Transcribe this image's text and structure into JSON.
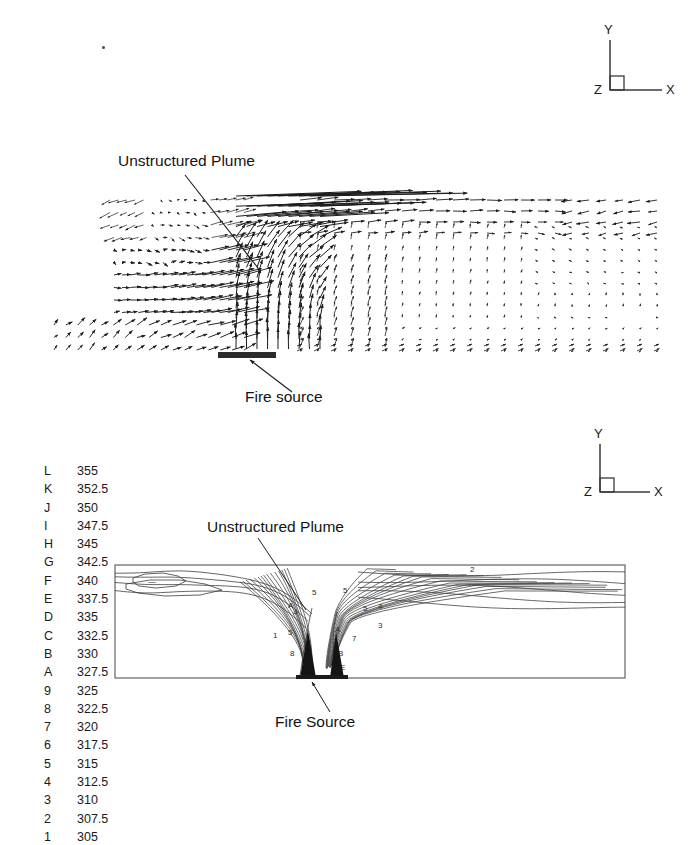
{
  "figure": {
    "panels": [
      {
        "id": "velocity-vector-panel",
        "type": "vector-field",
        "annotations": [
          {
            "label": "Unstructured Plume",
            "x": 118,
            "y": 162
          },
          {
            "label": "Fire source",
            "x": 245,
            "y": 400
          }
        ],
        "axis_triad": {
          "x_label": "X",
          "y_label": "Y",
          "z_label": "Z"
        }
      },
      {
        "id": "temperature-contour-panel",
        "type": "contour",
        "annotations": [
          {
            "label": "Unstructured Plume",
            "x": 207,
            "y": 528
          },
          {
            "label": "Fire Source",
            "x": 275,
            "y": 722
          }
        ],
        "axis_triad": {
          "x_label": "X",
          "y_label": "Y",
          "z_label": "Z"
        }
      }
    ]
  },
  "legend": {
    "title": "",
    "rows": [
      {
        "key": "L",
        "value": "355"
      },
      {
        "key": "K",
        "value": "352.5"
      },
      {
        "key": "J",
        "value": "350"
      },
      {
        "key": "I",
        "value": "347.5"
      },
      {
        "key": "H",
        "value": "345"
      },
      {
        "key": "G",
        "value": "342.5"
      },
      {
        "key": "F",
        "value": "340"
      },
      {
        "key": "E",
        "value": "337.5"
      },
      {
        "key": "D",
        "value": "335"
      },
      {
        "key": "C",
        "value": "332.5"
      },
      {
        "key": "B",
        "value": "330"
      },
      {
        "key": "A",
        "value": "327.5"
      },
      {
        "key": "9",
        "value": "325"
      },
      {
        "key": "8",
        "value": "322.5"
      },
      {
        "key": "7",
        "value": "320"
      },
      {
        "key": "6",
        "value": "317.5"
      },
      {
        "key": "5",
        "value": "315"
      },
      {
        "key": "4",
        "value": "312.5"
      },
      {
        "key": "3",
        "value": "310"
      },
      {
        "key": "2",
        "value": "307.5"
      },
      {
        "key": "1",
        "value": "305"
      }
    ]
  },
  "chart_data": {
    "type": "contour",
    "title": "",
    "xlabel": "X",
    "ylabel": "Y",
    "variable": "Temperature (K)",
    "levels": [
      305,
      307.5,
      310,
      312.5,
      315,
      317.5,
      320,
      322.5,
      325,
      327.5,
      330,
      332.5,
      335,
      337.5,
      340,
      342.5,
      345,
      347.5,
      350,
      352.5,
      355
    ],
    "level_keys": [
      "1",
      "2",
      "3",
      "4",
      "5",
      "6",
      "7",
      "8",
      "9",
      "A",
      "B",
      "C",
      "D",
      "E",
      "F",
      "G",
      "H",
      "I",
      "J",
      "K",
      "L"
    ],
    "contour_inline_labels": [
      "3",
      "4",
      "5",
      "7",
      "A",
      "B",
      "E",
      "2"
    ],
    "legend_position": "left",
    "grid": false,
    "panels": [
      "velocity vectors",
      "temperature contours"
    ]
  },
  "triad_top": {
    "x": "X",
    "y": "Y",
    "z": "Z"
  },
  "triad_bottom": {
    "x": "X",
    "y": "Y",
    "z": "Z"
  }
}
